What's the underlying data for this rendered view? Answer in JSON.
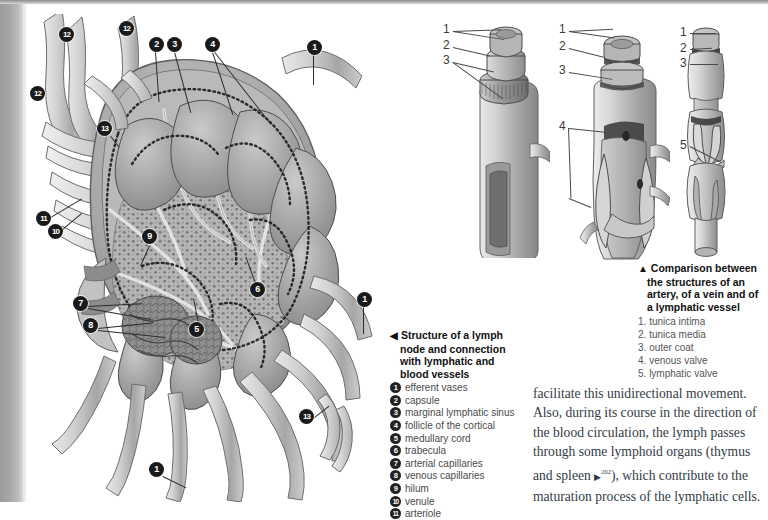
{
  "page": {
    "background_color": "#ffffff",
    "gutter_color": "#a9a9a9"
  },
  "figures": {
    "lymph_node": {
      "name": "Structure of a lymph node and connection with lymphatic and blood vessels",
      "callouts": [
        {
          "n": "1",
          "x": 314,
          "y": 48,
          "lx": 314,
          "ly": 48,
          "tx": 318,
          "ty": 80
        },
        {
          "n": "1",
          "x": 364,
          "y": 299,
          "lx": 364,
          "ly": 299,
          "tx": 366,
          "ty": 330
        },
        {
          "n": "1",
          "x": 156,
          "y": 469,
          "lx": 156,
          "ly": 469,
          "tx": 182,
          "ty": 487
        },
        {
          "n": "2",
          "x": 156,
          "y": 44,
          "lx": 156,
          "ly": 44,
          "tx": 160,
          "ty": 94
        },
        {
          "n": "3",
          "x": 174,
          "y": 44,
          "lx": 174,
          "ly": 44,
          "tx": 191,
          "ty": 105
        },
        {
          "n": "4",
          "x": 212,
          "y": 44,
          "lx": 212,
          "ly": 44,
          "tx": 232,
          "ty": 108
        },
        {
          "n": "5",
          "x": 196,
          "y": 329,
          "lx": 196,
          "ly": 329,
          "tx": 192,
          "ty": 300
        },
        {
          "n": "6",
          "x": 257,
          "y": 289,
          "lx": 257,
          "ly": 289,
          "tx": 246,
          "ty": 258
        },
        {
          "n": "7",
          "x": 80,
          "y": 303,
          "lx": 80,
          "ly": 303,
          "tx": 139,
          "ty": 302
        },
        {
          "n": "8",
          "x": 90,
          "y": 325,
          "lx": 90,
          "ly": 325,
          "tx": 151,
          "ty": 320
        },
        {
          "n": "9",
          "x": 149,
          "y": 236,
          "lx": 149,
          "ly": 236,
          "tx": 138,
          "ty": 262
        },
        {
          "n": "10",
          "x": 55,
          "y": 231,
          "lx": 55,
          "ly": 231,
          "tx": 79,
          "ty": 208
        },
        {
          "n": "11",
          "x": 43,
          "y": 218,
          "lx": 43,
          "ly": 218,
          "tx": 80,
          "ty": 196
        },
        {
          "n": "12",
          "x": 66,
          "y": 34,
          "lx": 66,
          "ly": 34,
          "tx": 66,
          "ty": 34
        },
        {
          "n": "12",
          "x": 126,
          "y": 28,
          "lx": 126,
          "ly": 28,
          "tx": 126,
          "ty": 28
        },
        {
          "n": "12",
          "x": 37,
          "y": 93,
          "lx": 37,
          "ly": 93,
          "tx": 37,
          "ty": 93
        },
        {
          "n": "13",
          "x": 104,
          "y": 128,
          "lx": 104,
          "ly": 128,
          "tx": 104,
          "ty": 128
        },
        {
          "n": "13",
          "x": 306,
          "y": 416,
          "lx": 306,
          "ly": 416,
          "tx": 306,
          "ty": 416
        }
      ]
    },
    "vessels": {
      "name": "Comparison between the structures of an artery, of a vein and of a lymphatic vessel",
      "artery_labels": [
        "1",
        "2",
        "3"
      ],
      "vein_labels": [
        "1",
        "2",
        "3",
        "4"
      ],
      "lymphatic_labels": [
        "1",
        "2",
        "3",
        "5"
      ]
    }
  },
  "caption_left": {
    "arrow": "◀",
    "title_lines": [
      "Structure of a lymph",
      "node and connection",
      "with lymphatic and",
      "blood vessels"
    ],
    "items": [
      {
        "n": "1",
        "label": "efferent vases"
      },
      {
        "n": "2",
        "label": "capsule"
      },
      {
        "n": "3",
        "label": "marginal lymphatic sinus"
      },
      {
        "n": "4",
        "label": "follicle of the cortical"
      },
      {
        "n": "5",
        "label": "medullary cord"
      },
      {
        "n": "6",
        "label": "trabecula"
      },
      {
        "n": "7",
        "label": "arterial capillaries"
      },
      {
        "n": "8",
        "label": "venous capillaries"
      },
      {
        "n": "9",
        "label": "hilum"
      },
      {
        "n": "10",
        "label": "venule"
      },
      {
        "n": "11",
        "label": "arteriole"
      }
    ]
  },
  "caption_right": {
    "arrow": "▲",
    "title_lines": [
      "Comparison between",
      "the structures of an",
      "artery, of a vein and of",
      "a lymphatic vessel"
    ],
    "items": [
      {
        "n": "1.",
        "label": "tunica intima"
      },
      {
        "n": "2.",
        "label": "tunica media"
      },
      {
        "n": "3.",
        "label": "outer coat"
      },
      {
        "n": "4.",
        "label": "venous valve"
      },
      {
        "n": "5.",
        "label": "lymphatic valve"
      }
    ]
  },
  "body": {
    "paragraph_part1": "facilitate this unidirectional movement. Also, during its course in the direction of the blood circulation, the lymph passes through some lymphoid organs (thymus and spleen ",
    "marker": "▶",
    "page_ref": "202",
    "paragraph_part2": "), which contribute to the maturation process of the lymphatic cells."
  }
}
